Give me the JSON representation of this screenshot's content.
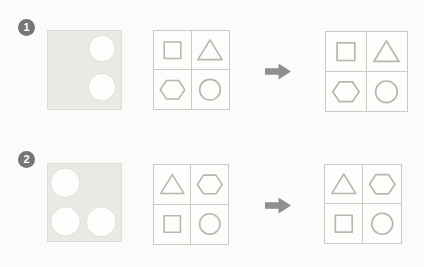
{
  "colors": {
    "page_bg": "#fbfbf9",
    "badge_bg": "#767676",
    "badge_text": "#ffffff",
    "mask_fill": "#e9e9e6",
    "mask_border": "#dcdcd8",
    "cutout_fill": "#fdfdfc",
    "cutout_stroke": "#d8d8d4",
    "grid_bg": "#fdfdfc",
    "grid_line": "#cbcbc6",
    "shape_stroke": "#b3b9af",
    "arrow_color": "#8f8f8f"
  },
  "rows": [
    {
      "badge": "1",
      "mask_square": {
        "w": 75,
        "h": 80,
        "circles": [
          {
            "cx": 55.5,
            "cy": 18,
            "r": 13.5
          },
          {
            "cx": 55.5,
            "cy": 57.5,
            "r": 14
          }
        ]
      },
      "source_grid": {
        "cells": [
          "square",
          "triangle",
          "hexagon",
          "circle"
        ]
      },
      "result_grid": {
        "cells": [
          "square",
          "triangle",
          "hexagon",
          "circle"
        ]
      }
    },
    {
      "badge": "2",
      "mask_square": {
        "w": 75,
        "h": 79,
        "circles": [
          {
            "cx": 17.7,
            "cy": 19.3,
            "r": 15
          },
          {
            "cx": 18,
            "cy": 59,
            "r": 15
          },
          {
            "cx": 54.7,
            "cy": 59.3,
            "r": 15.3
          }
        ]
      },
      "source_grid": {
        "cells": [
          "triangle",
          "hexagon",
          "square",
          "circle"
        ]
      },
      "result_grid": {
        "cells": [
          "triangle",
          "hexagon",
          "square",
          "circle"
        ]
      }
    }
  ]
}
